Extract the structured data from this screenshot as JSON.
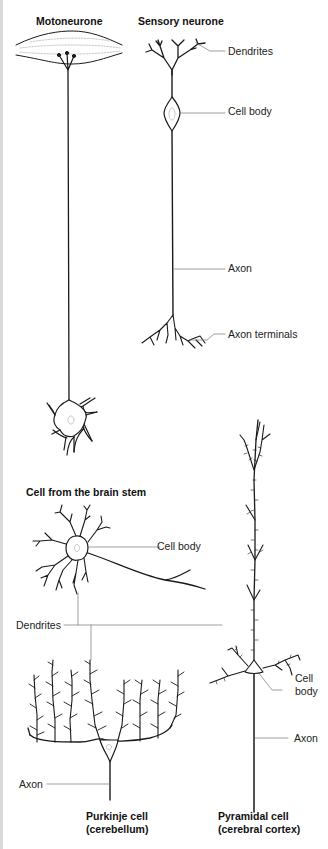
{
  "titles": {
    "motoneurone": "Motoneurone",
    "sensory": "Sensory neurone",
    "brain_stem": "Cell from the brain stem",
    "purkinje_line1": "Purkinje cell",
    "purkinje_line2": "(cerebellum)",
    "pyramidal_line1": "Pyramidal cell",
    "pyramidal_line2": "(cerebral cortex)"
  },
  "labels": {
    "sensory_dendrites": "Dendrites",
    "sensory_cell_body": "Cell body",
    "sensory_axon": "Axon",
    "sensory_axon_terminals": "Axon terminals",
    "brainstem_cell_body": "Cell body",
    "shared_dendrites": "Dendrites",
    "pyramidal_cell_line1": "Cell",
    "pyramidal_cell_line2": "body",
    "pyramidal_axon": "Axon",
    "purkinje_axon": "Axon"
  },
  "colors": {
    "ink": "#1a1a1a",
    "leader_line": "#777777",
    "border": "#d9d9d9",
    "background": "#ffffff"
  }
}
